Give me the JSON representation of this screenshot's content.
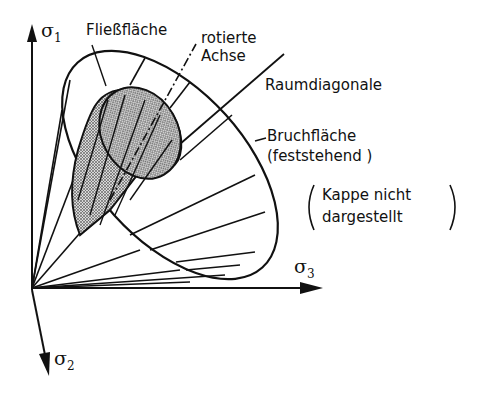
{
  "diagram": {
    "type": "yield-and-failure-surface-cone",
    "axes": {
      "sigma1": {
        "symbol": "σ",
        "sub": "1"
      },
      "sigma2": {
        "symbol": "σ",
        "sub": "2"
      },
      "sigma3": {
        "symbol": "σ",
        "sub": "3"
      }
    },
    "labels": {
      "yield_surface": "Fließfläche",
      "rotated_axis_line1": "rotierte",
      "rotated_axis_line2": "Achse",
      "space_diagonal": "Raumdiagonale",
      "failure_surface_line1": "Bruchfläche",
      "failure_surface_line2": "(feststehend )",
      "cap_note_line1": "Kappe  nicht",
      "cap_note_line2": "dargestellt"
    },
    "colors": {
      "ink": "#111111",
      "background": "#ffffff",
      "hatch": "#8a8a8a"
    }
  }
}
